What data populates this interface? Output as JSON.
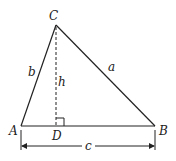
{
  "figure": {
    "type": "triangle-with-altitude",
    "vertices": {
      "A": {
        "label": "A",
        "x": 21,
        "y": 126
      },
      "B": {
        "label": "B",
        "x": 155,
        "y": 126
      },
      "C": {
        "label": "C",
        "x": 56,
        "y": 25
      },
      "D": {
        "label": "D",
        "x": 56,
        "y": 126
      }
    },
    "sides": {
      "a": {
        "label": "a",
        "from": "C",
        "to": "B"
      },
      "b": {
        "label": "b",
        "from": "A",
        "to": "C"
      },
      "c": {
        "label": "c",
        "from": "A",
        "to": "B"
      }
    },
    "altitude": {
      "label": "h",
      "from": "C",
      "to": "D",
      "style": "dashed"
    },
    "right_angle_marker": {
      "at": "D"
    },
    "colors": {
      "stroke": "#222222",
      "background": "#ffffff"
    }
  }
}
